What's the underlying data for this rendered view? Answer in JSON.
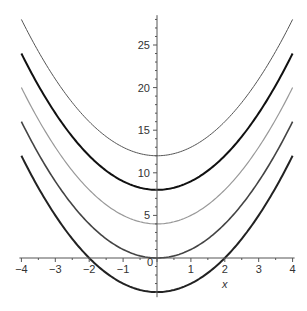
{
  "chart_data": {
    "type": "line",
    "title": "",
    "xlabel": "x",
    "ylabel": "",
    "xlim": [
      -4,
      4
    ],
    "ylim": [
      -4.6,
      28.5
    ],
    "grid": false,
    "legend": "none",
    "x_ticks": [
      -4,
      -3,
      -2,
      -1,
      0,
      1,
      2,
      3,
      4
    ],
    "x_tick_labels": [
      "−4",
      "−3",
      "−2",
      "−1",
      "",
      "1",
      "2",
      "3",
      "4"
    ],
    "y_ticks": [
      5,
      10,
      15,
      20,
      25
    ],
    "y_tick_labels": [
      "5",
      "10",
      "15",
      "20",
      "25"
    ],
    "origin_label": "0",
    "series": [
      {
        "name": "y = x^2 + 12",
        "offset": 12,
        "color": "#555555",
        "width": 1.0
      },
      {
        "name": "y = x^2 + 8",
        "offset": 8,
        "color": "#111111",
        "width": 2.0
      },
      {
        "name": "y = x^2 + 4",
        "offset": 4,
        "color": "#999999",
        "width": 1.2
      },
      {
        "name": "y = x^2",
        "offset": 0,
        "color": "#444444",
        "width": 1.6
      },
      {
        "name": "y = x^2 - 4",
        "offset": -4,
        "color": "#222222",
        "width": 2.0
      }
    ],
    "sample_points": {
      "x": [
        -4,
        -3,
        -2,
        -1,
        0,
        1,
        2,
        3,
        4
      ],
      "y_by_offset": {
        "12": [
          28,
          21,
          16,
          13,
          12,
          13,
          16,
          21,
          28
        ],
        "8": [
          24,
          17,
          12,
          9,
          8,
          9,
          12,
          17,
          24
        ],
        "4": [
          20,
          13,
          8,
          5,
          4,
          5,
          8,
          13,
          20
        ],
        "0": [
          16,
          9,
          4,
          1,
          0,
          1,
          4,
          9,
          16
        ],
        "-4": [
          12,
          5,
          0,
          -3,
          -4,
          -3,
          0,
          5,
          12
        ]
      }
    }
  }
}
